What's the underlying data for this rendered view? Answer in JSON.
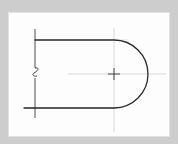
{
  "figure": {
    "type": "hand-drawn technical sketch",
    "colors": {
      "background_frame": "#cdcdcd",
      "paper": "#fdfdfd",
      "outline": "#2a2a2a",
      "construction_line": "#c8c8c8"
    },
    "elements": [
      "outline-top-line",
      "outline-bottom-line",
      "outline-arc",
      "left-edge-line",
      "break-symbol",
      "horizontal-center-line",
      "vertical-center-line",
      "center-mark"
    ]
  }
}
